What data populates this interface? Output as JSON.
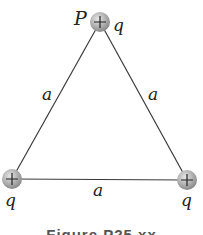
{
  "diagram": {
    "point_label": "P",
    "charges": [
      {
        "id": "top",
        "sign": "+",
        "label": "q",
        "cx": 100,
        "cy": 22
      },
      {
        "id": "bottom-left",
        "sign": "+",
        "label": "q",
        "cx": 12,
        "cy": 179
      },
      {
        "id": "bottom-right",
        "sign": "+",
        "label": "q",
        "cx": 187,
        "cy": 180
      }
    ],
    "sides": [
      {
        "id": "left",
        "label": "a"
      },
      {
        "id": "right",
        "label": "a"
      },
      {
        "id": "bottom",
        "label": "a"
      }
    ],
    "caption": "Figure P25.xx",
    "colors": {
      "line": "#3a3a3a",
      "charge_fill": "#b8b8b8",
      "charge_edge": "#8a8a8a",
      "text": "#222222"
    }
  }
}
